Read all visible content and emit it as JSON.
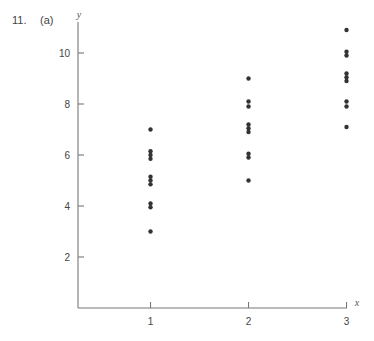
{
  "header": {
    "problem_number": "11.",
    "part_label": "(a)"
  },
  "chart_data": {
    "type": "scatter",
    "title": "",
    "xlabel": "x",
    "ylabel": "y",
    "xlim": [
      0.25,
      3.0
    ],
    "ylim": [
      0,
      11
    ],
    "x_ticks": [
      1,
      2,
      3
    ],
    "y_ticks": [
      2,
      4,
      6,
      8,
      10
    ],
    "grid": false,
    "legend": null,
    "series": [
      {
        "name": "data",
        "color": "#333333",
        "points": [
          [
            1,
            7.0
          ],
          [
            1,
            6.15
          ],
          [
            1,
            6.0
          ],
          [
            1,
            5.85
          ],
          [
            1,
            5.15
          ],
          [
            1,
            5.0
          ],
          [
            1,
            4.85
          ],
          [
            1,
            4.1
          ],
          [
            1,
            3.95
          ],
          [
            1,
            3.0
          ],
          [
            2,
            9.0
          ],
          [
            2,
            8.1
          ],
          [
            2,
            7.9
          ],
          [
            2,
            7.2
          ],
          [
            2,
            7.05
          ],
          [
            2,
            6.9
          ],
          [
            2,
            6.05
          ],
          [
            2,
            5.9
          ],
          [
            2,
            5.0
          ],
          [
            3,
            10.9
          ],
          [
            3,
            10.05
          ],
          [
            3,
            9.9
          ],
          [
            3,
            9.2
          ],
          [
            3,
            9.05
          ],
          [
            3,
            8.9
          ],
          [
            3,
            8.1
          ],
          [
            3,
            7.9
          ],
          [
            3,
            7.1
          ]
        ]
      }
    ]
  },
  "plot_frame": {
    "x0_px": 78,
    "y0_px": 308,
    "x_px_per_unit": 98,
    "x_origin_value": 0.26,
    "y_px_per_unit": 25.5,
    "x_axis_end_px": 347,
    "y_axis_top_px": 22
  }
}
